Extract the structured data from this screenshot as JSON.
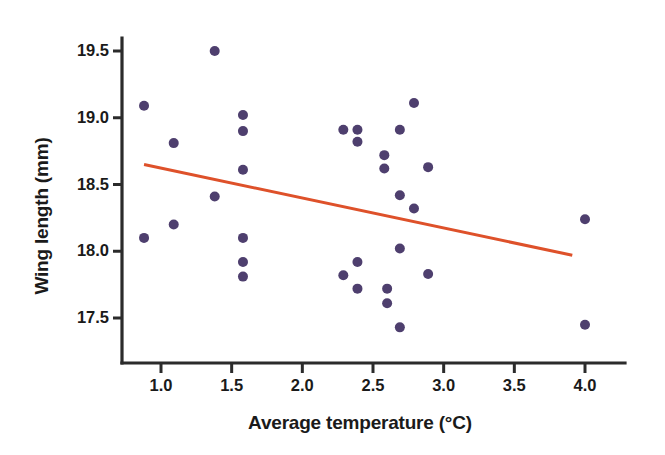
{
  "chart_data": {
    "type": "scatter",
    "title": "",
    "xlabel": "Average temperature (°C)",
    "ylabel": "Wing length (mm)",
    "xlim": [
      0.72,
      4.22
    ],
    "ylim": [
      17.28,
      19.62
    ],
    "xticks": [
      1.0,
      1.5,
      2.0,
      2.5,
      3.0,
      3.5,
      4.0
    ],
    "xtick_labels": [
      "1.0",
      "1.5",
      "2.0",
      "2.5",
      "3.0",
      "3.5",
      "4.0"
    ],
    "yticks": [
      17.5,
      18.0,
      18.5,
      19.0,
      19.5
    ],
    "ytick_labels": [
      "17.5",
      "18.0",
      "18.5",
      "19.0",
      "19.5"
    ],
    "grid": false,
    "legend": "none",
    "point_color": "#4e3f6e",
    "point_radius_px": 5,
    "line_color": "#de512a",
    "line_width_px": 3,
    "axis_color": "#2b2b2b",
    "points": [
      {
        "x": 0.88,
        "y": 19.09
      },
      {
        "x": 0.88,
        "y": 18.1
      },
      {
        "x": 1.09,
        "y": 18.81
      },
      {
        "x": 1.09,
        "y": 18.2
      },
      {
        "x": 1.38,
        "y": 19.5
      },
      {
        "x": 1.38,
        "y": 18.41
      },
      {
        "x": 1.58,
        "y": 19.02
      },
      {
        "x": 1.58,
        "y": 18.9
      },
      {
        "x": 1.58,
        "y": 18.61
      },
      {
        "x": 1.58,
        "y": 18.1
      },
      {
        "x": 1.58,
        "y": 17.92
      },
      {
        "x": 1.58,
        "y": 17.81
      },
      {
        "x": 2.29,
        "y": 18.91
      },
      {
        "x": 2.29,
        "y": 17.82
      },
      {
        "x": 2.39,
        "y": 18.91
      },
      {
        "x": 2.39,
        "y": 18.82
      },
      {
        "x": 2.39,
        "y": 17.92
      },
      {
        "x": 2.39,
        "y": 17.72
      },
      {
        "x": 2.58,
        "y": 18.72
      },
      {
        "x": 2.58,
        "y": 18.62
      },
      {
        "x": 2.6,
        "y": 17.72
      },
      {
        "x": 2.6,
        "y": 17.61
      },
      {
        "x": 2.69,
        "y": 18.91
      },
      {
        "x": 2.69,
        "y": 18.42
      },
      {
        "x": 2.69,
        "y": 18.02
      },
      {
        "x": 2.69,
        "y": 17.43
      },
      {
        "x": 2.79,
        "y": 19.11
      },
      {
        "x": 2.79,
        "y": 18.32
      },
      {
        "x": 2.89,
        "y": 18.63
      },
      {
        "x": 2.89,
        "y": 17.83
      },
      {
        "x": 4.0,
        "y": 18.24
      },
      {
        "x": 4.0,
        "y": 17.45
      }
    ],
    "trendline": {
      "x_start": 0.88,
      "y_start": 18.65,
      "x_end": 3.91,
      "y_end": 17.97,
      "description": "linear regression fit, negative slope"
    }
  }
}
